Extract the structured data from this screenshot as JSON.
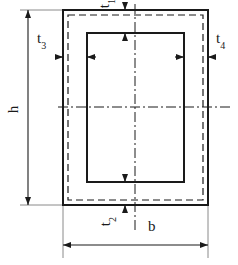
{
  "figure": {
    "type": "engineering-cross-section",
    "background_color": "#ffffff",
    "line_color": "#1a1a1a"
  },
  "labels": {
    "height": {
      "base": "h",
      "sub": ""
    },
    "width": {
      "base": "b",
      "sub": ""
    },
    "thickness_top": {
      "base": "t",
      "sub": "1"
    },
    "thickness_bottom": {
      "base": "t",
      "sub": "2"
    },
    "thickness_left": {
      "base": "t",
      "sub": "3"
    },
    "thickness_right": {
      "base": "t",
      "sub": "4"
    }
  },
  "geometry": {
    "outer_rect": {
      "x": 63,
      "y": 10,
      "width": 145,
      "height": 195
    },
    "dashed_rect": {
      "x": 68,
      "y": 15,
      "width": 135,
      "height": 185
    },
    "inner_rect": {
      "x": 87,
      "y": 33,
      "width": 97,
      "height": 149
    },
    "center_x": 135,
    "center_y": 107,
    "dimension_line_h_x": 28,
    "dimension_line_b_y": 245
  }
}
